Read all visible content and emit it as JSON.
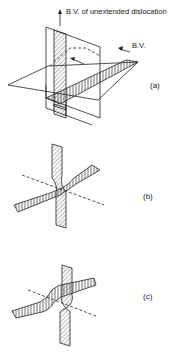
{
  "figure": {
    "panels": [
      {
        "id": "a",
        "label": "(a)",
        "annotations": {
          "vertical_arrow_label": "B.V. of unextended dislocation",
          "horizontal_arrow_label": "B.V."
        }
      },
      {
        "id": "b",
        "label": "(b)"
      },
      {
        "id": "c",
        "label": "(c)"
      }
    ]
  },
  "colors": {
    "ink": "#222222",
    "background": "#ffffff"
  }
}
